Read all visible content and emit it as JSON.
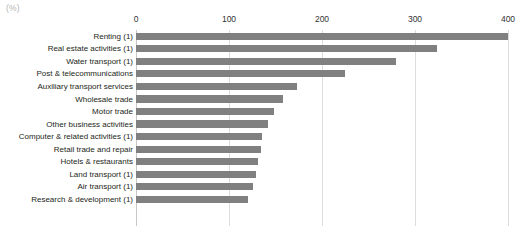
{
  "unit_label": "(%)",
  "chart_data": {
    "type": "bar",
    "orientation": "horizontal",
    "title": "",
    "xlabel": "(%)",
    "ylabel": "",
    "xlim": [
      0,
      400
    ],
    "xticks": [
      0,
      100,
      200,
      300,
      400
    ],
    "xtick_labels": [
      "0",
      "100",
      "200",
      "300",
      "400"
    ],
    "grid": true,
    "legend": false,
    "bar_color": "#808080",
    "gridline_color": "#dcdcdc",
    "categories": [
      "Renting (1)",
      "Real estate activities (1)",
      "Water transport (1)",
      "Post & telecommunications",
      "Auxiliary transport services",
      "Wholesale trade",
      "Motor trade",
      "Other business activities",
      "Computer & related activities (1)",
      "Retail trade and repair",
      "Hotels & restaurants",
      "Land transport (1)",
      "Air transport (1)",
      "Research & development (1)"
    ],
    "values": [
      400,
      324,
      280,
      225,
      173,
      158,
      148,
      142,
      135,
      134,
      131,
      129,
      126,
      120
    ]
  }
}
